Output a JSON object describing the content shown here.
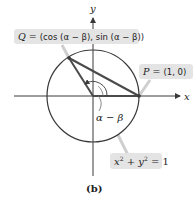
{
  "figure": {
    "caption": "(b)",
    "axes": {
      "x_label": "x",
      "y_label": "y"
    },
    "point_q": {
      "name": "Q",
      "eq": " = ",
      "coords": "(cos (α − β), sin (α − β))"
    },
    "point_p": {
      "name": "P",
      "eq": " = ",
      "coords": "(1, 0)"
    },
    "angle_label": "α − β",
    "circle_equation": {
      "lhs_x": "x",
      "sup1": "2",
      "plus": " + ",
      "lhs_y": "y",
      "sup2": "2",
      "rhs": " = 1"
    },
    "colors": {
      "line": "#3a3a3a",
      "label_box": "#e4e4e4",
      "leader": "#cfcfcf"
    }
  }
}
